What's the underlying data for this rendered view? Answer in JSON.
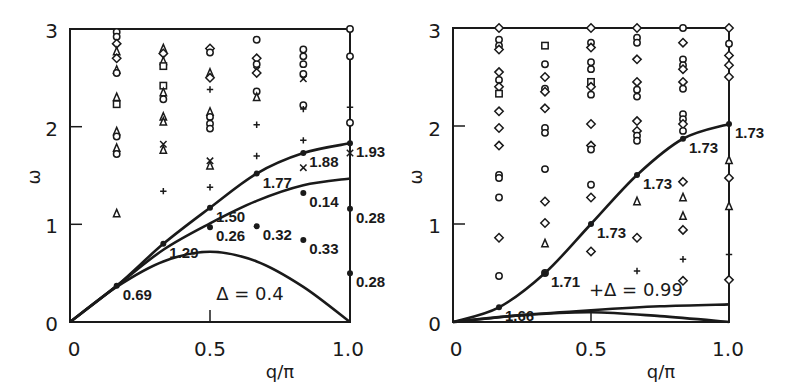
{
  "chart_data": [
    {
      "type": "scatter",
      "panel": "left",
      "title": "",
      "xlabel": "q/π",
      "ylabel": "ω",
      "xlim": [
        0,
        1.0
      ],
      "ylim": [
        0,
        3
      ],
      "x_ticks": [
        "0",
        "0.5",
        "1.0"
      ],
      "y_ticks": [
        "0",
        "1",
        "2",
        "3"
      ],
      "annotation": "Δ = 0.4",
      "curves": [
        {
          "name": "upper branch",
          "x": [
            0,
            0.1667,
            0.3333,
            0.5,
            0.6667,
            0.8333,
            1.0
          ],
          "y": [
            0,
            0.37,
            0.8,
            1.17,
            1.52,
            1.73,
            1.83
          ]
        },
        {
          "name": "middle branch",
          "x": [
            0,
            0.1667,
            0.3333,
            0.5,
            0.6667,
            0.8333,
            1.0
          ],
          "y": [
            0,
            0.37,
            0.74,
            1.01,
            1.24,
            1.4,
            1.47
          ]
        },
        {
          "name": "lower branch",
          "x": [
            0,
            0.1667,
            0.3333,
            0.5,
            0.6667,
            0.8333,
            1.0
          ],
          "y": [
            0,
            0.36,
            0.62,
            0.72,
            0.62,
            0.36,
            0
          ]
        }
      ],
      "point_labels": [
        {
          "x": 0.1667,
          "y": 0.37,
          "text": "0.69"
        },
        {
          "x": 0.3333,
          "y": 0.8,
          "text": "1.29"
        },
        {
          "x": 0.5,
          "y": 1.17,
          "text": "1.50"
        },
        {
          "x": 0.6667,
          "y": 1.52,
          "text": "1.77"
        },
        {
          "x": 0.8333,
          "y": 1.73,
          "text": "1.88"
        },
        {
          "x": 1.0,
          "y": 1.83,
          "text": "1.93"
        },
        {
          "x": 0.8333,
          "y": 1.32,
          "text": "0.14"
        },
        {
          "x": 0.5,
          "y": 0.97,
          "text": "0.26"
        },
        {
          "x": 0.6667,
          "y": 0.98,
          "text": "0.32"
        },
        {
          "x": 0.8333,
          "y": 0.84,
          "text": "0.33"
        },
        {
          "x": 1.0,
          "y": 1.16,
          "text": "0.28"
        },
        {
          "x": 1.0,
          "y": 0.5,
          "text": "0.28"
        }
      ],
      "scatter": [
        {
          "x": 0.1667,
          "y": [
            2.97,
            2.92,
            2.85,
            2.77,
            2.7,
            2.58,
            2.55,
            2.3,
            2.23,
            1.95,
            1.9,
            1.78,
            1.72,
            1.11
          ],
          "markers": [
            "o",
            "o",
            "d",
            "t",
            "d",
            "t",
            "o",
            "t",
            "s",
            "t",
            "o",
            "t",
            "o",
            "t"
          ]
        },
        {
          "x": 0.3333,
          "y": [
            2.8,
            2.75,
            2.67,
            2.62,
            2.42,
            2.35,
            2.28,
            2.1,
            2.05,
            1.82,
            1.76,
            1.34
          ],
          "markers": [
            "t",
            "d",
            "t",
            "s",
            "s",
            "t",
            "o",
            "t",
            "t",
            "x",
            "t",
            "+"
          ]
        },
        {
          "x": 0.5,
          "y": [
            2.8,
            2.76,
            2.55,
            2.5,
            2.38,
            2.15,
            2.1,
            2.03,
            1.98,
            1.65,
            1.6,
            1.38
          ],
          "markers": [
            "d",
            "o",
            "t",
            "d",
            "+",
            "t",
            "o",
            "o",
            "o",
            "x",
            "t",
            "+"
          ]
        },
        {
          "x": 0.6667,
          "y": [
            2.89,
            2.7,
            2.64,
            2.58,
            2.55,
            2.36,
            2.3,
            2.02,
            1.7
          ],
          "markers": [
            "o",
            "d",
            "o",
            "x",
            "d",
            "o",
            "t",
            "+",
            "+"
          ]
        },
        {
          "x": 0.8333,
          "y": [
            2.79,
            2.72,
            2.64,
            2.54,
            2.49,
            2.22,
            2.18,
            1.86,
            1.58
          ],
          "markers": [
            "o",
            "o",
            "o",
            "o",
            "x",
            "o",
            "+",
            "+",
            "x"
          ]
        },
        {
          "x": 1.0,
          "y": [
            3.0,
            2.72,
            2.2,
            2.04,
            1.73
          ],
          "markers": [
            "o",
            "o",
            "+",
            "o",
            "x"
          ]
        }
      ]
    },
    {
      "type": "scatter",
      "panel": "right",
      "title": "",
      "xlabel": "q/π",
      "ylabel": "ω",
      "xlim": [
        0,
        1.0
      ],
      "ylim": [
        0,
        3
      ],
      "x_ticks": [
        "0",
        "0.5",
        "1.0"
      ],
      "y_ticks": [
        "0",
        "1",
        "2",
        "3"
      ],
      "annotation": "Δ = 0.99",
      "curves": [
        {
          "name": "main branch",
          "x": [
            0,
            0.1667,
            0.3333,
            0.5,
            0.6667,
            0.8333,
            1.0
          ],
          "y": [
            0,
            0.15,
            0.5,
            1.0,
            1.5,
            1.87,
            2.02
          ]
        },
        {
          "name": "low branch a",
          "x": [
            0,
            0.25,
            0.5,
            0.75,
            1.0
          ],
          "y": [
            0,
            0.07,
            0.12,
            0.16,
            0.18
          ]
        },
        {
          "name": "low branch b",
          "x": [
            0,
            0.25,
            0.5,
            0.75,
            1.0
          ],
          "y": [
            0,
            0.07,
            0.1,
            0.06,
            0
          ]
        }
      ],
      "point_labels": [
        {
          "x": 0.1667,
          "y": 0.15,
          "text": "1.66"
        },
        {
          "x": 0.3333,
          "y": 0.5,
          "text": "1.71"
        },
        {
          "x": 0.5,
          "y": 1.0,
          "text": "1.73"
        },
        {
          "x": 0.6667,
          "y": 1.5,
          "text": "1.73"
        },
        {
          "x": 0.8333,
          "y": 1.87,
          "text": "1.73"
        },
        {
          "x": 1.0,
          "y": 2.02,
          "text": "1.73"
        }
      ],
      "scatter": [
        {
          "x": 0.1667,
          "y": [
            3.0,
            2.88,
            2.82,
            2.78,
            2.55,
            2.47,
            2.4,
            2.33,
            2.15,
            1.98,
            1.8,
            1.5,
            1.47,
            1.27,
            0.86,
            0.47
          ],
          "markers": [
            "d",
            "o",
            "o",
            "d",
            "d",
            "o",
            "d",
            "s",
            "d",
            "d",
            "d",
            "o",
            "o",
            "o",
            "d",
            "o"
          ]
        },
        {
          "x": 0.3333,
          "y": [
            2.82,
            2.63,
            2.5,
            2.38,
            2.35,
            2.18,
            1.98,
            1.93,
            1.56,
            1.23,
            1.01,
            0.8,
            0.5
          ],
          "markers": [
            "s",
            "o",
            "d",
            "o",
            "d",
            "d",
            "o",
            "o",
            "o",
            "d",
            "d",
            "t",
            "o"
          ]
        },
        {
          "x": 0.5,
          "y": [
            3.0,
            2.85,
            2.8,
            2.65,
            2.58,
            2.45,
            2.4,
            2.32,
            2.02,
            1.8,
            1.76,
            1.4,
            1.27,
            0.72
          ],
          "markers": [
            "d",
            "o",
            "d",
            "o",
            "o",
            "s",
            "d",
            "o",
            "d",
            "d",
            "o",
            "o",
            "d",
            "d"
          ]
        },
        {
          "x": 0.6667,
          "y": [
            3.0,
            2.9,
            2.85,
            2.68,
            2.45,
            2.37,
            2.3,
            2.05,
            1.95,
            1.9,
            1.85,
            1.23,
            0.86,
            0.52
          ],
          "markers": [
            "d",
            "o",
            "o",
            "d",
            "d",
            "o",
            "o",
            "d",
            "d",
            "o",
            "o",
            "t",
            "d",
            "+"
          ]
        },
        {
          "x": 0.8333,
          "y": [
            3.0,
            2.85,
            2.68,
            2.62,
            2.58,
            2.45,
            2.38,
            2.12,
            2.07,
            2.02,
            1.95,
            1.43,
            1.27,
            1.08,
            0.94,
            0.64,
            0.42
          ],
          "markers": [
            "o",
            "d",
            "o",
            "o",
            "d",
            "d",
            "o",
            "o",
            "o",
            "d",
            "o",
            "d",
            "t",
            "t",
            "d",
            "+",
            "d"
          ]
        },
        {
          "x": 1.0,
          "y": [
            3.0,
            2.84,
            2.72,
            2.62,
            2.5,
            1.65,
            1.47,
            1.18,
            0.69,
            0.43
          ],
          "markers": [
            "d",
            "o",
            "d",
            "d",
            "d",
            "t",
            "d",
            "t",
            "+",
            "d"
          ]
        }
      ]
    }
  ],
  "panels": {
    "left": {
      "xlabel": "q/π",
      "ylabel": "ω",
      "x_ticks": [
        "0",
        "0.5",
        "1.0"
      ],
      "y_ticks": [
        "0",
        "1",
        "2",
        "3"
      ],
      "annotation": "Δ = 0.4"
    },
    "right": {
      "xlabel": "q/π",
      "ylabel": "ω",
      "x_ticks": [
        "0",
        "0.5",
        "1.0"
      ],
      "y_ticks": [
        "0",
        "1",
        "2",
        "3"
      ],
      "annotation": "+Δ = 0.99"
    }
  },
  "colors": {
    "ink": "#1a1a1a",
    "background": "#ffffff"
  }
}
